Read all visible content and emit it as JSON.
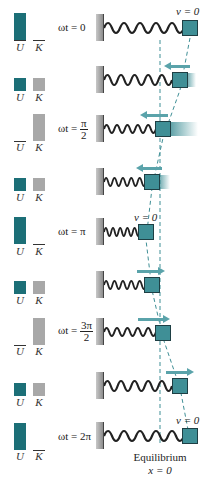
{
  "figure": {
    "energy_labels": {
      "U": "U",
      "K": "K"
    },
    "colors": {
      "potential": "#1c6f77",
      "kinetic": "#a8a8a8",
      "block": "#3f8f96",
      "arrow": "#5aa3aa",
      "dashed": "#3f8f96"
    },
    "rows": [
      {
        "phase": "ωt = 0",
        "phase_num": "",
        "phase_den": "",
        "U_height": 30,
        "K_height": 0,
        "velocity_label": "v = 0",
        "arrow": "none"
      },
      {
        "phase": "",
        "U_height": 15,
        "K_height": 15,
        "velocity_label": "",
        "arrow": "left"
      },
      {
        "phase_prefix": "ωt =",
        "phase_num": "π",
        "phase_den": "2",
        "U_height": 0,
        "K_height": 30,
        "velocity_label": "",
        "arrow": "left"
      },
      {
        "phase": "",
        "U_height": 15,
        "K_height": 15,
        "velocity_label": "",
        "arrow": "left"
      },
      {
        "phase": "ωt = π",
        "U_height": 30,
        "K_height": 0,
        "velocity_label": "v = 0",
        "arrow": "none"
      },
      {
        "phase": "",
        "U_height": 15,
        "K_height": 15,
        "velocity_label": "",
        "arrow": "right"
      },
      {
        "phase_prefix": "ωt =",
        "phase_num": "3π",
        "phase_den": "2",
        "U_height": 0,
        "K_height": 30,
        "velocity_label": "",
        "arrow": "right"
      },
      {
        "phase": "",
        "U_height": 15,
        "K_height": 15,
        "velocity_label": "",
        "arrow": "right"
      },
      {
        "phase": "ωt = 2π",
        "U_height": 30,
        "K_height": 0,
        "velocity_label": "v = 0",
        "arrow": "none"
      }
    ],
    "caption": {
      "line1": "Equilibrium",
      "line2": "x = 0"
    }
  }
}
